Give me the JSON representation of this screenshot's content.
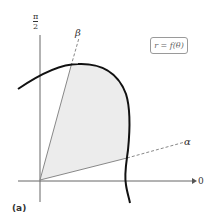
{
  "figure": {
    "caption": "(a)",
    "equation_label": "r = f(θ)",
    "axis_labels": {
      "vertical_top_numerator": "π",
      "vertical_top_denominator": "2",
      "horizontal_right": "0"
    },
    "ray_labels": {
      "beta": "β",
      "alpha": "α"
    },
    "colors": {
      "shaded_region": "#ececec",
      "curve": "#111111",
      "rays": "#888888",
      "axes": "#555555"
    }
  }
}
